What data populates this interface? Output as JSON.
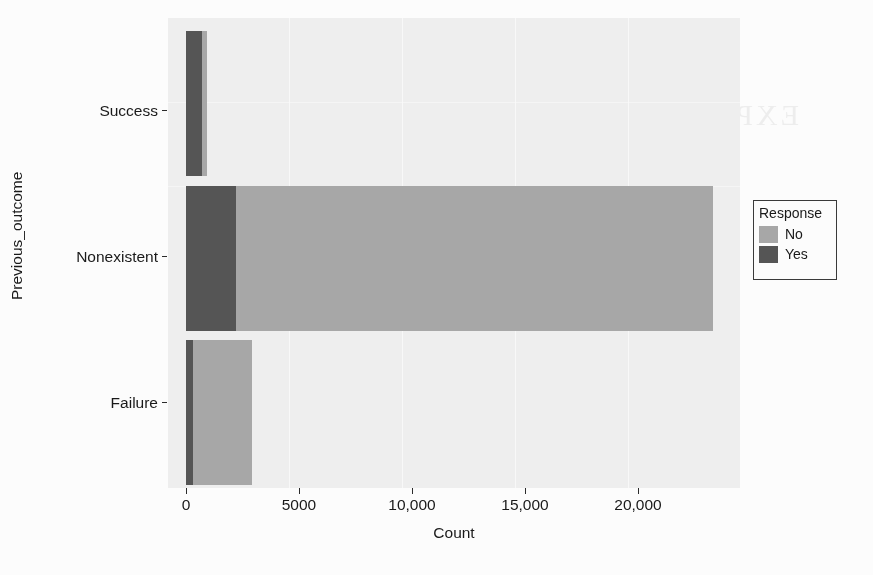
{
  "chart_data": {
    "type": "bar",
    "orientation": "horizontal",
    "stacked": true,
    "title": "",
    "xlabel": "Count",
    "ylabel": "Previous_outcome",
    "categories": [
      "Success",
      "Nonexistent",
      "Failure"
    ],
    "series": [
      {
        "name": "No",
        "color": "#a9a9a9",
        "values": [
          200,
          21100,
          2600
        ]
      },
      {
        "name": "Yes",
        "color": "#565656",
        "values": [
          700,
          2200,
          330
        ]
      }
    ],
    "totals": [
      900,
      23300,
      2930
    ],
    "xlim": [
      0,
      25300
    ],
    "xticks": [
      0,
      5000,
      10000,
      15000,
      20000
    ],
    "xtick_labels": [
      "0",
      "5000",
      "10,000",
      "15,000",
      "20,000"
    ],
    "grid": "minimal",
    "legend_position": "right",
    "panel_background": "#f1f1f1"
  },
  "axes": {
    "y_title": "Previous_outcome",
    "x_title": "Count",
    "y_tick_labels": [
      "Success",
      "Nonexistent",
      "Failure"
    ],
    "x_tick_labels": [
      "0",
      "5000",
      "10,000",
      "15,000",
      "20,000"
    ]
  },
  "legend": {
    "title": "Response",
    "entries": [
      {
        "label": "No",
        "color": "#a9a9a9"
      },
      {
        "label": "Yes",
        "color": "#565656"
      }
    ]
  },
  "bleed_through": {
    "heading": "EXPLORATORY DATA ANALYSIS",
    "subheading": "RESULTS",
    "line_a": "a stacked bar chart of previous outcome versus count of response",
    "line_b": "the vast majority of contacts had no previous outcome recorded",
    "line_c": "and the response rate for those contacts is relatively low",
    "logo": "A+"
  },
  "colors": {
    "yes": "#565656",
    "no": "#a9a9a9",
    "panel": "#f1f1f1",
    "page": "#ffffff",
    "text": "#1a1a1a"
  }
}
